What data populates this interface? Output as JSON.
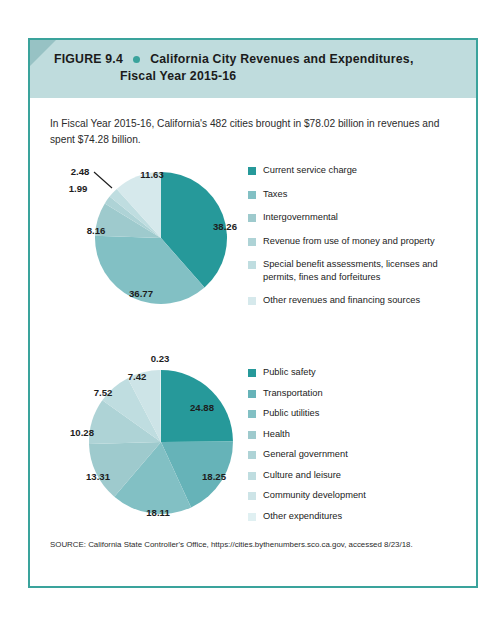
{
  "figure": {
    "number": "FIGURE 9.4",
    "bullet_icon": "bullet-dot",
    "title_line1": "California City Revenues and Expenditures,",
    "title_line2": "Fiscal Year 2015-16",
    "intro": "In Fiscal Year 2015-16, California's 482 cities brought in $78.02 billion in revenues and spent $74.28 billion.",
    "source": "SOURCE: California State Controller's Office, https://cities.bythenumbers.sco.ca.gov, accessed 8/23/18."
  },
  "palette": {
    "header_band": "#bfdcdd",
    "header_fold": "#97c2c4",
    "border": "#3aa39c",
    "text": "#1d1d1d"
  },
  "chart_data": [
    {
      "type": "pie",
      "title": "California City Revenues, Fiscal Year 2015-16",
      "units": "percent of total revenues",
      "total_label": "$78.02 billion",
      "legend_position": "right",
      "categories": [
        "Current service charge",
        "Taxes",
        "Intergovernmental",
        "Revenue from use of money and property",
        "Special benefit assessments, licenses and permits, fines and forfeitures",
        "Other revenues and financing sources"
      ],
      "values": [
        38.26,
        36.77,
        8.16,
        1.99,
        2.48,
        11.63
      ],
      "colors": [
        "#26999a",
        "#82c0c4",
        "#9ecacd",
        "#aed3d6",
        "#bfdde0",
        "#d6e9ec"
      ],
      "labels": [
        "38.26",
        "36.77",
        "8.16",
        "1.99",
        "2.48",
        "11.63"
      ],
      "label_points": [
        {
          "text": "38.26",
          "x": 177,
          "y": 68
        },
        {
          "text": "36.77",
          "x": 93,
          "y": 135
        },
        {
          "text": "8.16",
          "x": 48,
          "y": 72
        },
        {
          "text": "1.99",
          "x": 30,
          "y": 30
        },
        {
          "text": "2.48",
          "x": 32,
          "y": 13
        },
        {
          "text": "11.63",
          "x": 104,
          "y": 16
        }
      ]
    },
    {
      "type": "pie",
      "title": "California City Expenditures, Fiscal Year 2015-16",
      "units": "percent of total expenditures",
      "total_label": "$74.28 billion",
      "legend_position": "right",
      "categories": [
        "Public safety",
        "Transportation",
        "Public utilities",
        "Health",
        "General government",
        "Culture and leisure",
        "Community development",
        "Other expenditures"
      ],
      "values": [
        24.88,
        18.25,
        18.11,
        13.31,
        10.28,
        7.52,
        7.42,
        0.23
      ],
      "colors": [
        "#26999a",
        "#66b3b8",
        "#82c0c4",
        "#9ecacd",
        "#aed3d6",
        "#bfdde0",
        "#cde4e7",
        "#e0f0f2"
      ],
      "labels": [
        "24.88",
        "18.25",
        "18.11",
        "13.31",
        "10.28",
        "7.52",
        "7.42",
        "0.23"
      ],
      "label_points": [
        {
          "text": "24.88",
          "x": 154,
          "y": 57
        },
        {
          "text": "18.25",
          "x": 166,
          "y": 126
        },
        {
          "text": "18.11",
          "x": 110,
          "y": 162
        },
        {
          "text": "13.31",
          "x": 50,
          "y": 126
        },
        {
          "text": "10.28",
          "x": 34,
          "y": 82
        },
        {
          "text": "7.52",
          "x": 55,
          "y": 42
        },
        {
          "text": "7.42",
          "x": 89,
          "y": 26
        },
        {
          "text": "0.23",
          "x": 112,
          "y": 8
        }
      ]
    }
  ]
}
